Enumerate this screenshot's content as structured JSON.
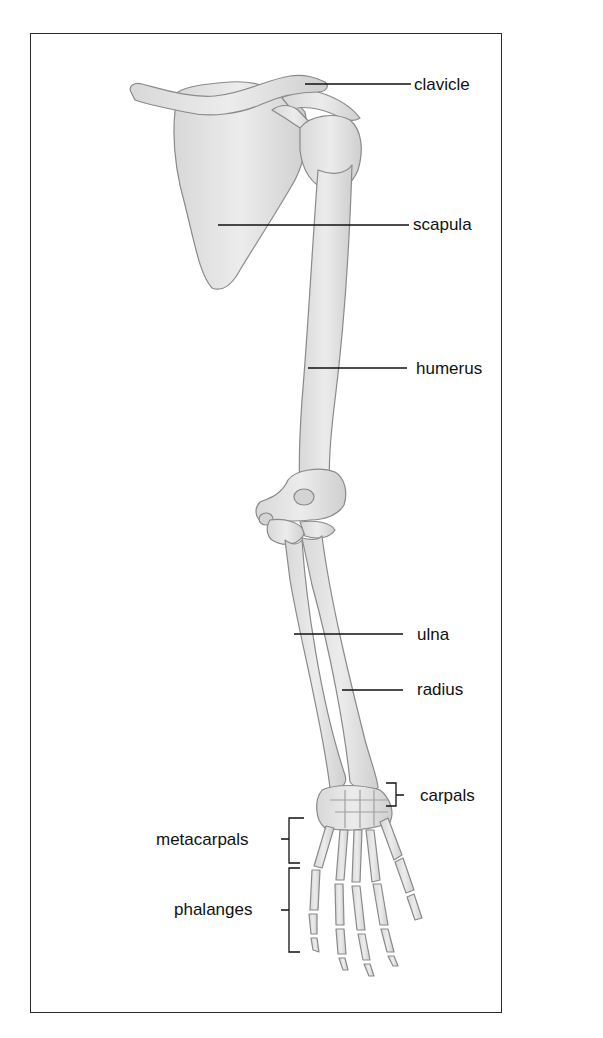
{
  "diagram": {
    "type": "labeled anatomical illustration",
    "labels": [
      {
        "id": "clavicle",
        "text": "clavicle"
      },
      {
        "id": "scapula",
        "text": "scapula"
      },
      {
        "id": "humerus",
        "text": "humerus"
      },
      {
        "id": "ulna",
        "text": "ulna"
      },
      {
        "id": "radius",
        "text": "radius"
      },
      {
        "id": "carpals",
        "text": "carpals"
      },
      {
        "id": "metacarpals",
        "text": "metacarpals"
      },
      {
        "id": "phalanges",
        "text": "phalanges"
      }
    ],
    "colors": {
      "frame": "#2a2a2a",
      "bone_fill": "#e6e6e6",
      "bone_stroke": "#8a8a8a",
      "leader": "#111111"
    }
  }
}
